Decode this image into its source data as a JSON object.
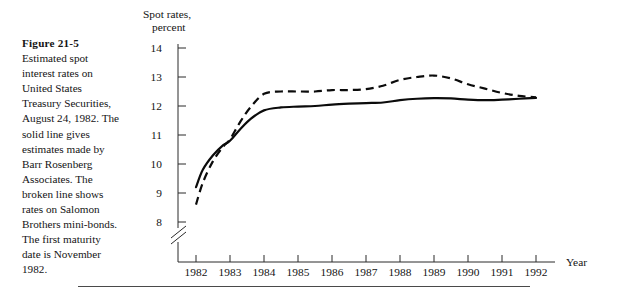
{
  "figure": {
    "title": "Figure 21-5",
    "caption": "Estimated spot interest rates on United States Treasury Securities, August 24, 1982. The solid line gives estimates made by Barr Rosenberg Associates. The broken line shows rates on Salomon Brothers mini-bonds. The first maturity date is November 1982."
  },
  "chart_data": {
    "type": "line",
    "title": "",
    "ylabel": "Spot rates, percent",
    "xlabel": "Year",
    "ylim": [
      8,
      14
    ],
    "xlim": [
      1982,
      1992
    ],
    "grid": false,
    "legend_position": "none",
    "y_axis_break": true,
    "y_ticks": [
      14,
      13,
      12,
      11,
      10,
      9,
      8
    ],
    "x_ticks": [
      1982,
      1983,
      1984,
      1985,
      1986,
      1987,
      1988,
      1989,
      1990,
      1991,
      1992
    ],
    "x": [
      1982.0,
      1982.2,
      1982.5,
      1982.8,
      1983.0,
      1983.3,
      1983.6,
      1984.0,
      1984.5,
      1985.0,
      1985.5,
      1986.0,
      1986.5,
      1987.0,
      1987.5,
      1988.0,
      1988.5,
      1989.0,
      1989.5,
      1990.0,
      1990.5,
      1991.0,
      1991.5,
      1992.0
    ],
    "series": [
      {
        "name": "Barr Rosenberg Associates estimates",
        "style": "solid",
        "values": [
          9.2,
          9.8,
          10.3,
          10.65,
          10.8,
          11.2,
          11.55,
          11.85,
          11.95,
          11.98,
          12.0,
          12.05,
          12.08,
          12.1,
          12.12,
          12.2,
          12.25,
          12.27,
          12.26,
          12.22,
          12.2,
          12.22,
          12.25,
          12.28
        ]
      },
      {
        "name": "Salomon Brothers mini-bonds rates",
        "style": "dashed",
        "values": [
          8.6,
          9.35,
          10.1,
          10.6,
          10.85,
          11.45,
          11.95,
          12.42,
          12.5,
          12.5,
          12.5,
          12.55,
          12.55,
          12.58,
          12.7,
          12.9,
          13.0,
          13.05,
          12.95,
          12.75,
          12.6,
          12.45,
          12.35,
          12.3
        ]
      }
    ]
  }
}
